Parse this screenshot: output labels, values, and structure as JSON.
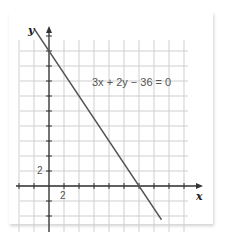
{
  "chart_data": {
    "type": "line",
    "title": "",
    "equation": "3x + 2y − 36 = 0",
    "xlabel": "x",
    "ylabel": "y",
    "tick_labels": {
      "x": "2",
      "y": "2"
    },
    "tick_step": 2,
    "grid": true,
    "xlim": [
      -4,
      19
    ],
    "ylim": [
      -6,
      20
    ],
    "series": [
      {
        "name": "3x + 2y − 36 = 0",
        "x": [
          -2,
          15
        ],
        "y": [
          21,
          -4.5
        ]
      }
    ],
    "intercepts": {
      "x": 12,
      "y": 18
    },
    "colors": {
      "line": "#555555",
      "grid": "#cfcfcf",
      "axis": "#333333"
    }
  },
  "labels": {
    "x_axis": "x",
    "y_axis": "y",
    "x_tick": "2",
    "y_tick": "2",
    "equation": "3x + 2y − 36 = 0"
  }
}
